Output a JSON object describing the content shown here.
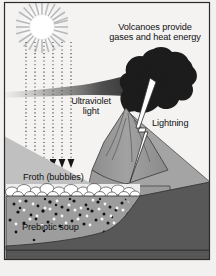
{
  "figure": {
    "background_color": "#f2f1ef",
    "frame_color": "#2b2b2b",
    "width": 216,
    "height": 276
  },
  "labels": {
    "volcano": "Volcanoes provide\ngases and heat energy",
    "ultraviolet": "Ultraviolet\nlight",
    "lightning": "Lightning",
    "froth": "Froth (bubbles)",
    "soup": "Prebiotic soup"
  },
  "elements": {
    "sun": {
      "name": "Sun",
      "cx": 42,
      "cy": 27,
      "core_radius": 12,
      "ray_count": 24,
      "ray_length": 16,
      "color": "#b9b9b9"
    },
    "uv_rays": {
      "name": "Ultraviolet light rays",
      "count": 6,
      "style": "dotted",
      "x_positions": [
        26,
        35,
        44,
        53,
        62,
        71
      ],
      "y_start": 44,
      "y_end": 162,
      "arrowhead": "down-triangle",
      "color": "#2b2b2b"
    },
    "volcano": {
      "name": "Volcano",
      "cone_color": "#9a9a9a",
      "slope_color": "#a8a8a8",
      "summit_x": 126,
      "summit_y": 108
    },
    "plume": {
      "name": "Volcanic ash plume",
      "color": "#1d1d1d",
      "lobe_count": 7
    },
    "haze": {
      "name": "Drifting smoke haze",
      "color": "#5a5a5a"
    },
    "lightning": {
      "name": "Lightning bolt",
      "color": "#ffffff",
      "stroke": "#2b2b2b"
    },
    "froth": {
      "name": "Froth bubble layer",
      "bubble_color": "#ffffff",
      "bubble_count": 34,
      "stroke": "#3a3a3a"
    },
    "soup": {
      "name": "Prebiotic soup layer",
      "fill_color": "#9d9d9d",
      "dark_speck_color": "#141414",
      "light_speck_color": "#f4f4f4",
      "speck_count": 120
    },
    "bedrock": {
      "name": "Bedrock",
      "color": "#575757"
    },
    "shore": {
      "name": "Left shore slope",
      "color": "#bfbfbf"
    }
  }
}
